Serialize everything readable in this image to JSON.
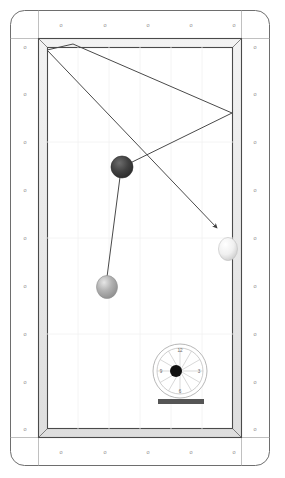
{
  "scene": {
    "title": "Billiards Shot Diagram",
    "description": "Top-down pool table diagram with cue ball path, two object balls, and a spin/tip-position dial",
    "background_color": "#ffffff"
  },
  "table": {
    "name": "pool-table",
    "outer_frame": {
      "x": 10,
      "y": 10,
      "width": 260,
      "height": 456,
      "corner_radius": 14,
      "fill": "#ffffff",
      "stroke": "#6e6e6e",
      "stroke_width": 1.0
    },
    "rail_band": {
      "stroke": "#9a9a9a",
      "fill": "#fcfcfc",
      "top_line_y": 38,
      "bottom_line_y": 438,
      "left_line_x": 38,
      "right_line_x": 242
    },
    "cushion": {
      "x": 38,
      "y": 38,
      "width": 204,
      "height": 400,
      "thickness": 6,
      "fill": "#e8e8e8",
      "stroke": "#4a4a4a",
      "stroke_width": 1.2
    },
    "playfield": {
      "x": 47,
      "y": 47,
      "width": 186,
      "height": 382,
      "fill": "#ffffff",
      "grid_color": "#f0f0f0",
      "grid_visible": true
    }
  },
  "sights": {
    "name": "diamond-sights",
    "glyph": "o",
    "color": "#8a8a8a",
    "font_size": 5.5,
    "top": [
      {
        "x": 61,
        "y": 25
      },
      {
        "x": 105,
        "y": 25
      },
      {
        "x": 148,
        "y": 25
      },
      {
        "x": 191,
        "y": 25
      },
      {
        "x": 234,
        "y": 25
      }
    ],
    "bottom": [
      {
        "x": 61,
        "y": 452
      },
      {
        "x": 105,
        "y": 452
      },
      {
        "x": 148,
        "y": 452
      },
      {
        "x": 191,
        "y": 452
      },
      {
        "x": 234,
        "y": 452
      }
    ],
    "left": [
      {
        "x": 25,
        "y": 47
      },
      {
        "x": 25,
        "y": 94
      },
      {
        "x": 25,
        "y": 142
      },
      {
        "x": 25,
        "y": 190
      },
      {
        "x": 25,
        "y": 238
      },
      {
        "x": 25,
        "y": 286
      },
      {
        "x": 25,
        "y": 334
      },
      {
        "x": 25,
        "y": 382
      },
      {
        "x": 25,
        "y": 429
      }
    ],
    "right": [
      {
        "x": 255,
        "y": 47
      },
      {
        "x": 255,
        "y": 94
      },
      {
        "x": 255,
        "y": 142
      },
      {
        "x": 255,
        "y": 190
      },
      {
        "x": 255,
        "y": 238
      },
      {
        "x": 255,
        "y": 286
      },
      {
        "x": 255,
        "y": 334
      },
      {
        "x": 255,
        "y": 382
      },
      {
        "x": 255,
        "y": 429
      }
    ]
  },
  "balls": [
    {
      "name": "object-ball-dark",
      "label": "dark ball",
      "cx": 122,
      "cy": 167,
      "r": 11,
      "fill": "#3a3a3a",
      "highlight": "#6d6d6d",
      "stroke": "#2a2a2a"
    },
    {
      "name": "object-ball-gray",
      "label": "gray ball",
      "cx": 107,
      "cy": 287,
      "r": 11,
      "fill": "#a8a8a8",
      "highlight": "#e2e2e2",
      "stroke": "#8a8a8a"
    },
    {
      "name": "cue-ball-white",
      "label": "white cue ball",
      "cx": 228,
      "cy": 249,
      "r": 11,
      "fill": "#f2f2f2",
      "highlight": "#ffffff",
      "stroke": "#b5b5b5"
    }
  ],
  "paths": {
    "name": "shot-trajectory",
    "stroke": "#4a4a4a",
    "stroke_width": 1.0,
    "bank_path": {
      "name": "bank-line",
      "points": [
        {
          "x": 47,
          "y": 50
        },
        {
          "x": 73,
          "y": 44
        },
        {
          "x": 232,
          "y": 113
        },
        {
          "x": 122,
          "y": 167
        }
      ]
    },
    "aim_path": {
      "name": "aim-line-with-arrow",
      "points": [
        {
          "x": 47,
          "y": 50
        },
        {
          "x": 219,
          "y": 230
        }
      ],
      "arrowhead": true,
      "arrow_tip": {
        "x": 219,
        "y": 230
      }
    },
    "contact_path": {
      "name": "contact-line",
      "points": [
        {
          "x": 122,
          "y": 175
        },
        {
          "x": 107,
          "y": 278
        }
      ]
    }
  },
  "dial": {
    "name": "tip-position-dial",
    "cx": 180,
    "cy": 371,
    "outer_r": 27,
    "inner_r": 23,
    "ring_stroke": "#9a9a9a",
    "spoke_stroke": "#c8c8c8",
    "spoke_count": 12,
    "center_dot": {
      "cx": 176,
      "cy": 371,
      "r": 6,
      "fill": "#111111"
    },
    "numerals": [
      {
        "text": "12",
        "x": 180,
        "y": 352
      },
      {
        "text": "3",
        "x": 199,
        "y": 373
      },
      {
        "text": "6",
        "x": 180,
        "y": 393
      },
      {
        "text": "9",
        "x": 161,
        "y": 373
      }
    ],
    "numeral_color": "#6a6a6a",
    "numeral_size": 4.5,
    "cue_bar": {
      "name": "cue-stick-bar",
      "x": 158,
      "y": 399,
      "width": 46,
      "height": 5,
      "fill": "#555555"
    }
  }
}
